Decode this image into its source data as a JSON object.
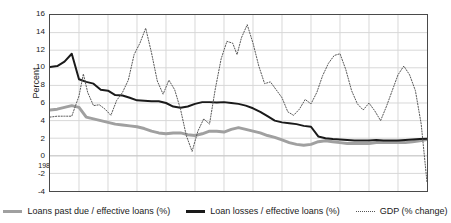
{
  "chart_data": {
    "type": "line",
    "title": "",
    "xlabel": "",
    "ylabel": "Percent",
    "grid": true,
    "legend_position": "bottom",
    "ylim": [
      -4,
      16
    ],
    "xlim": [
      1986.0,
      1999.0
    ],
    "ytick_labels": [
      "16",
      "14",
      "12",
      "10",
      "8",
      "6",
      "4",
      "2",
      "0",
      "-2",
      "-4"
    ],
    "yticks": [
      16,
      14,
      12,
      10,
      8,
      6,
      4,
      2,
      0,
      -2,
      -4
    ],
    "xtick_labels": [
      "1986.1",
      "1987.1",
      "1988.1",
      "1989.1",
      "1990.1",
      "1991.1",
      "1992.1",
      "1993.1",
      "1994.1",
      "1995.1",
      "1996.1",
      "1997.1",
      "1998.1"
    ],
    "xticks": [
      1986.0,
      1987.0,
      1988.0,
      1989.0,
      1990.0,
      1991.0,
      1992.0,
      1993.0,
      1994.0,
      1995.0,
      1996.0,
      1997.0,
      1998.0
    ],
    "series": [
      {
        "name": "Loans past due / effective loans (%)",
        "style": "solid",
        "color": "#a0a0a0",
        "width": 3,
        "x": [
          1986.0,
          1986.25,
          1986.5,
          1986.75,
          1987.0,
          1987.25,
          1987.5,
          1987.75,
          1988.0,
          1988.25,
          1988.5,
          1988.75,
          1989.0,
          1989.25,
          1989.5,
          1989.75,
          1990.0,
          1990.25,
          1990.5,
          1990.75,
          1991.0,
          1991.25,
          1991.5,
          1991.75,
          1992.0,
          1992.25,
          1992.5,
          1992.75,
          1993.0,
          1993.25,
          1993.5,
          1993.75,
          1994.0,
          1994.25,
          1994.5,
          1994.75,
          1995.0,
          1995.25,
          1995.5,
          1995.75,
          1996.0,
          1996.25,
          1996.5,
          1996.75,
          1997.0,
          1997.25,
          1997.5,
          1997.75,
          1998.0,
          1998.25,
          1998.5,
          1998.75,
          1999.0
        ],
        "values": [
          5.2,
          5.3,
          5.5,
          5.7,
          5.5,
          4.4,
          4.2,
          4.0,
          3.8,
          3.6,
          3.5,
          3.4,
          3.3,
          3.1,
          2.8,
          2.6,
          2.5,
          2.6,
          2.6,
          2.4,
          2.3,
          2.5,
          2.8,
          2.8,
          2.7,
          3.0,
          3.2,
          3.0,
          2.8,
          2.6,
          2.3,
          2.1,
          1.8,
          1.5,
          1.3,
          1.2,
          1.3,
          1.6,
          1.7,
          1.6,
          1.5,
          1.4,
          1.4,
          1.4,
          1.4,
          1.5,
          1.5,
          1.5,
          1.5,
          1.5,
          1.6,
          1.7,
          1.85
        ]
      },
      {
        "name": "Loan losses / effective loans (%)",
        "style": "solid",
        "color": "#1a1a1a",
        "width": 2,
        "x": [
          1986.0,
          1986.25,
          1986.5,
          1986.75,
          1987.0,
          1987.25,
          1987.5,
          1987.75,
          1988.0,
          1988.25,
          1988.5,
          1988.75,
          1989.0,
          1989.25,
          1989.5,
          1989.75,
          1990.0,
          1990.25,
          1990.5,
          1990.75,
          1991.0,
          1991.25,
          1991.5,
          1991.75,
          1992.0,
          1992.25,
          1992.5,
          1992.75,
          1993.0,
          1993.25,
          1993.5,
          1993.75,
          1994.0,
          1994.25,
          1994.5,
          1994.75,
          1995.0,
          1995.25,
          1995.5,
          1995.75,
          1996.0,
          1996.25,
          1996.5,
          1996.75,
          1997.0,
          1997.25,
          1997.5,
          1997.75,
          1998.0,
          1998.25,
          1998.5,
          1998.75,
          1999.0
        ],
        "values": [
          10.1,
          10.2,
          10.7,
          11.6,
          8.7,
          8.4,
          8.2,
          7.5,
          7.4,
          6.9,
          6.85,
          6.6,
          6.3,
          6.25,
          6.2,
          6.2,
          6.0,
          5.6,
          5.45,
          5.6,
          5.9,
          6.1,
          6.1,
          6.05,
          6.1,
          6.0,
          5.9,
          5.7,
          5.4,
          5.0,
          4.5,
          4.0,
          3.8,
          3.7,
          3.6,
          3.4,
          3.3,
          2.2,
          2.0,
          1.9,
          1.85,
          1.8,
          1.75,
          1.75,
          1.75,
          1.8,
          1.75,
          1.75,
          1.75,
          1.8,
          1.85,
          1.9,
          1.95
        ]
      },
      {
        "name": "GDP (% change)",
        "style": "dotted",
        "color": "#555555",
        "width": 1,
        "x": [
          1986.0,
          1986.25,
          1986.5,
          1986.75,
          1987.0,
          1987.15,
          1987.3,
          1987.5,
          1987.7,
          1987.9,
          1988.1,
          1988.3,
          1988.5,
          1988.7,
          1988.9,
          1989.1,
          1989.3,
          1989.5,
          1989.7,
          1989.9,
          1990.1,
          1990.3,
          1990.5,
          1990.7,
          1990.9,
          1991.1,
          1991.3,
          1991.5,
          1991.7,
          1991.9,
          1992.1,
          1992.3,
          1992.45,
          1992.6,
          1992.8,
          1993.0,
          1993.2,
          1993.4,
          1993.6,
          1993.8,
          1994.0,
          1994.2,
          1994.4,
          1994.6,
          1994.8,
          1995.0,
          1995.2,
          1995.4,
          1995.6,
          1995.8,
          1996.0,
          1996.2,
          1996.4,
          1996.6,
          1996.8,
          1997.0,
          1997.2,
          1997.4,
          1997.6,
          1997.8,
          1998.0,
          1998.2,
          1998.4,
          1998.6,
          1998.8,
          1999.0
        ],
        "values": [
          4.4,
          4.5,
          4.5,
          4.5,
          6.8,
          9.3,
          7.2,
          5.7,
          5.8,
          5.3,
          4.6,
          6.3,
          7.2,
          8.6,
          11.5,
          12.8,
          14.5,
          11.7,
          8.5,
          7.0,
          8.6,
          7.5,
          5.3,
          2.3,
          0.5,
          2.8,
          4.2,
          3.6,
          7.6,
          11.0,
          13.0,
          12.8,
          11.5,
          13.4,
          14.9,
          12.8,
          10.2,
          8.2,
          8.4,
          7.5,
          6.6,
          5.0,
          4.6,
          5.3,
          6.4,
          5.9,
          7.2,
          9.1,
          10.5,
          11.4,
          11.6,
          9.8,
          7.4,
          5.9,
          5.2,
          6.0,
          5.1,
          4.0,
          5.6,
          7.4,
          9.2,
          10.2,
          9.2,
          7.4,
          3.6,
          -3.0
        ]
      }
    ]
  },
  "legend": {
    "items": [
      {
        "label": "Loans past due / effective loans (%)",
        "swatch": "gray-solid-line"
      },
      {
        "label": "Loan losses / effective loans (%)",
        "swatch": "black-solid-line"
      },
      {
        "label": "GDP (% change)",
        "swatch": "dotted-line"
      }
    ]
  },
  "colors": {
    "loans_past_due": "#a0a0a0",
    "loan_losses": "#1a1a1a",
    "gdp": "#555555",
    "grid": "#d8d8d8",
    "frame": "#4a4a4a",
    "background": "#ffffff"
  }
}
